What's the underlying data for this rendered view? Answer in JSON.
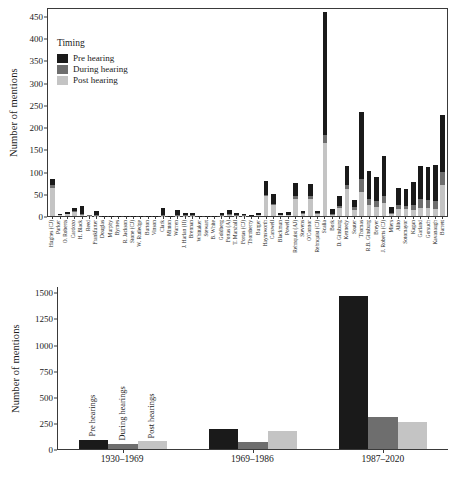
{
  "legend": {
    "title": "Timing",
    "entries": [
      {
        "label": "Pre hearing",
        "color": "#1a1a1a"
      },
      {
        "label": "During hearing",
        "color": "#6e6e6e"
      },
      {
        "label": "Post hearing",
        "color": "#c4c4c4"
      }
    ]
  },
  "top": {
    "ylabel": "Number of mentions",
    "yticks": [
      "0",
      "50",
      "100",
      "150",
      "200",
      "250",
      "300",
      "350",
      "400",
      "450"
    ]
  },
  "bottom": {
    "ylabel": "Number of mentions",
    "yticks": [
      "0",
      "250",
      "500",
      "750",
      "1000",
      "1250",
      "1500"
    ],
    "bar_captions": [
      "Pre hearings",
      "During hearings",
      "Post hearings"
    ]
  },
  "chart_data": [
    {
      "type": "bar",
      "id": "justice-mentions-by-timing",
      "subtype": "stacked-vertical",
      "title": "",
      "xlabel": "",
      "ylabel": "Number of mentions",
      "ylim": [
        0,
        470
      ],
      "yticks": [
        0,
        50,
        100,
        150,
        200,
        250,
        300,
        350,
        400,
        450
      ],
      "grid": false,
      "legend": {
        "title": "Timing",
        "position": "upper-left-inside"
      },
      "categories": [
        "Hughes (CJ)",
        "Parker",
        "O. Roberts",
        "Cardozo",
        "H. Black",
        "Reed",
        "Frankfurter",
        "Douglas",
        "Murphy",
        "Byrnes",
        "R. Jackson",
        "Stone (CJ)",
        "W. Rutledge",
        "Burton",
        "Vinson",
        "Clark",
        "Minton",
        "Warren",
        "J. Harlan (II)",
        "Brennan",
        "Whittaker",
        "Stewart",
        "B. White",
        "Goldberg",
        "Fortas (A)",
        "T. Marshall",
        "Fortas (CJ)",
        "Thornberry",
        "Burger",
        "Haynsworth",
        "Carswell",
        "Blackmun",
        "Powell",
        "Rehnquist (AJ)",
        "Stevens",
        "O'Connor",
        "Rehnquist (CJ)",
        "Scalia",
        "Bork",
        "D. Ginsburg",
        "Kennedy",
        "Souter",
        "Thomas",
        "R.B. Ginsburg",
        "Breyer",
        "J. Roberts (CJ)",
        "Miers",
        "Alito",
        "Sotomayor",
        "Kagan",
        "Garland",
        "Gorsuch",
        "Kavanaugh",
        "Barrett"
      ],
      "series": [
        {
          "name": "Pre hearing",
          "color": "#1a1a1a",
          "values": [
            14,
            2,
            3,
            8,
            18,
            1,
            9,
            1,
            1,
            1,
            1,
            1,
            1,
            1,
            1,
            15,
            1,
            11,
            5,
            4,
            1,
            1,
            1,
            4,
            10,
            4,
            3,
            2,
            3,
            30,
            21,
            3,
            5,
            30,
            6,
            29,
            6,
            275,
            10,
            21,
            42,
            16,
            150,
            62,
            55,
            90,
            13,
            40,
            38,
            52,
            74,
            75,
            80,
            130
          ]
        },
        {
          "name": "During hearing",
          "color": "#6e6e6e",
          "values": [
            8,
            1,
            1,
            2,
            2,
            1,
            1,
            0,
            0,
            0,
            0,
            0,
            0,
            0,
            0,
            1,
            0,
            1,
            1,
            1,
            0,
            0,
            0,
            1,
            2,
            1,
            1,
            0,
            1,
            3,
            4,
            1,
            1,
            7,
            2,
            6,
            2,
            18,
            2,
            5,
            10,
            6,
            28,
            14,
            13,
            16,
            3,
            9,
            8,
            11,
            20,
            18,
            18,
            28
          ]
        },
        {
          "name": "Post hearing",
          "color": "#c4c4c4",
          "values": [
            62,
            2,
            4,
            9,
            2,
            1,
            1,
            0,
            0,
            0,
            0,
            0,
            0,
            0,
            0,
            1,
            0,
            1,
            1,
            1,
            0,
            0,
            0,
            1,
            2,
            1,
            1,
            0,
            2,
            45,
            24,
            2,
            2,
            38,
            4,
            38,
            4,
            165,
            3,
            18,
            60,
            14,
            55,
            25,
            20,
            30,
            4,
            15,
            15,
            14,
            18,
            18,
            16,
            70
          ]
        }
      ]
    },
    {
      "type": "bar",
      "id": "mentions-by-era-and-timing",
      "subtype": "grouped-vertical",
      "title": "",
      "xlabel": "",
      "ylabel": "Number of mentions",
      "ylim": [
        0,
        1560
      ],
      "yticks": [
        0,
        250,
        500,
        750,
        1000,
        1250,
        1500
      ],
      "grid": false,
      "categories": [
        "1930–1969",
        "1969–1986",
        "1987–2020"
      ],
      "series": [
        {
          "name": "Pre hearings",
          "color": "#1a1a1a",
          "values": [
            90,
            195,
            1460
          ]
        },
        {
          "name": "During hearings",
          "color": "#6e6e6e",
          "values": [
            50,
            70,
            305
          ]
        },
        {
          "name": "Post hearings",
          "color": "#c4c4c4",
          "values": [
            75,
            175,
            255
          ]
        }
      ]
    }
  ]
}
